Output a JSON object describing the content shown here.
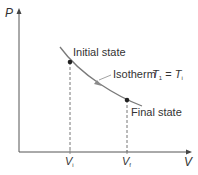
{
  "diagram": {
    "axes": {
      "y_label": "P",
      "x_label": "V"
    },
    "curve": {
      "name": "Isotherm",
      "color": "#7a7a7a",
      "arrow_color": "#8a8a8a"
    },
    "points": {
      "initial": {
        "label": "Initial state",
        "v_label": "V",
        "v_sub": "i"
      },
      "final": {
        "label": "Final state",
        "v_label": "V",
        "v_sub": "f"
      }
    },
    "annotation": {
      "isotherm_label": "Isotherm",
      "condition_lhs": "T",
      "condition_lhs_sub": "1",
      "condition_eq": "=",
      "condition_rhs": "T",
      "condition_rhs_sub": "i"
    },
    "colors": {
      "axis": "#555555",
      "text": "#333333",
      "point": "#222222",
      "dashed": "#777777"
    }
  }
}
